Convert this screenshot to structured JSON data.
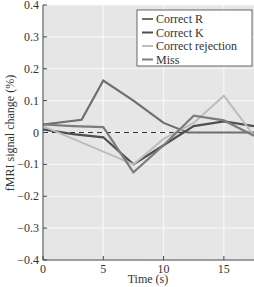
{
  "chart_data": {
    "type": "line",
    "title": "",
    "xlabel": "Time (s)",
    "ylabel": "fMRI signal change (%)",
    "xlim": [
      0,
      17.5
    ],
    "ylim": [
      -0.4,
      0.4
    ],
    "xticks": [
      0,
      5,
      10,
      15
    ],
    "yticks": [
      -0.4,
      -0.3,
      -0.2,
      -0.1,
      0,
      0.1,
      0.2,
      0.3,
      0.4
    ],
    "ytick_labels": [
      "−0.4",
      "−0.3",
      "−0.2",
      "−0.1",
      "0",
      "0.1",
      "0.2",
      "0.3",
      "0.4"
    ],
    "grid": true,
    "baseline": {
      "y": 0,
      "style": "dashed"
    },
    "legend_position": "upper right",
    "series": [
      {
        "name": "Correct R",
        "color": "#6e6e6e",
        "width": 2.2,
        "x": [
          0,
          3.2,
          5,
          7.5,
          10,
          12,
          15,
          17.5
        ],
        "values": [
          0.025,
          0.04,
          0.163,
          0.1,
          0.03,
          0.0,
          0.0,
          0.0
        ]
      },
      {
        "name": "Correct K",
        "color": "#4f4f4f",
        "width": 2.2,
        "x": [
          0,
          2.5,
          5,
          7.5,
          10,
          12.5,
          15,
          17.5
        ],
        "values": [
          0.01,
          -0.005,
          -0.015,
          -0.1,
          -0.04,
          0.02,
          0.035,
          0.02
        ]
      },
      {
        "name": "Correct rejection",
        "color": "#bdbdbd",
        "width": 2.0,
        "x": [
          0,
          2.5,
          5,
          7.5,
          10,
          12.5,
          15,
          17.5
        ],
        "values": [
          0.02,
          -0.02,
          -0.06,
          -0.1,
          -0.02,
          0.03,
          0.115,
          -0.01
        ]
      },
      {
        "name": "Miss",
        "color": "#7c7c7c",
        "width": 2.2,
        "x": [
          0,
          2.5,
          5,
          7.5,
          10,
          12.5,
          15,
          17.5
        ],
        "values": [
          0.025,
          0.02,
          0.017,
          -0.125,
          -0.04,
          0.053,
          0.038,
          -0.01
        ]
      }
    ]
  },
  "colors": {
    "plot_background": "#e6e6e6",
    "gridline": "#f7f7f7",
    "axis": "#444444"
  }
}
